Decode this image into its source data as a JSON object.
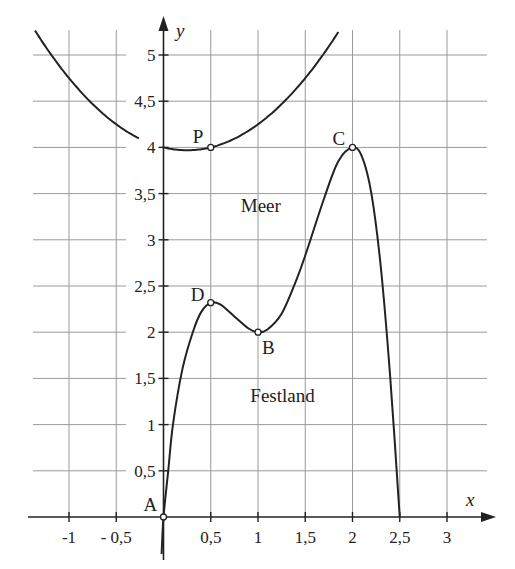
{
  "diagram": {
    "axes": {
      "x_label": "x",
      "y_label": "y",
      "x_ticks": [
        {
          "value": -1,
          "label": "-1"
        },
        {
          "value": -0.5,
          "label": "- 0,5"
        },
        {
          "value": 0.5,
          "label": "0,5"
        },
        {
          "value": 1,
          "label": "1"
        },
        {
          "value": 1.5,
          "label": "1,5"
        },
        {
          "value": 2,
          "label": "2"
        },
        {
          "value": 2.5,
          "label": "2,5"
        },
        {
          "value": 3,
          "label": "3"
        }
      ],
      "y_ticks": [
        {
          "value": 0.5,
          "label": "0,5"
        },
        {
          "value": 1,
          "label": "1"
        },
        {
          "value": 1.5,
          "label": "1,5"
        },
        {
          "value": 2,
          "label": "2"
        },
        {
          "value": 2.5,
          "label": "2,5"
        },
        {
          "value": 3,
          "label": "3"
        },
        {
          "value": 3.5,
          "label": "3,5"
        },
        {
          "value": 4,
          "label": "4"
        },
        {
          "value": 4.5,
          "label": "4,5"
        },
        {
          "value": 5,
          "label": "5"
        }
      ],
      "x_range": [
        -1.4,
        3.4
      ],
      "y_range": [
        -0.4,
        5.3
      ],
      "grid": true
    },
    "points": [
      {
        "name": "A",
        "x": 0,
        "y": 0,
        "label_dx": -20,
        "label_dy": -6
      },
      {
        "name": "D",
        "x": 0.5,
        "y": 2.32,
        "label_dx": -20,
        "label_dy": -2
      },
      {
        "name": "B",
        "x": 1,
        "y": 2,
        "label_dx": 4,
        "label_dy": 22
      },
      {
        "name": "C",
        "x": 2,
        "y": 4,
        "label_dx": -20,
        "label_dy": -2
      },
      {
        "name": "P",
        "x": 0.5,
        "y": 4,
        "label_dx": -18,
        "label_dy": -4
      }
    ],
    "regions": [
      {
        "label": "Meer",
        "x": 1.03,
        "y": 3.3
      },
      {
        "label": "Festland",
        "x": 1.26,
        "y": 1.25
      }
    ],
    "curves": {
      "coast": [
        [
          -0.02,
          -0.4
        ],
        [
          0,
          0
        ],
        [
          0.05,
          0.5
        ],
        [
          0.1,
          1.0
        ],
        [
          0.2,
          1.6
        ],
        [
          0.31,
          2.0
        ],
        [
          0.4,
          2.22
        ],
        [
          0.5,
          2.32
        ],
        [
          0.6,
          2.3
        ],
        [
          0.75,
          2.17
        ],
        [
          0.9,
          2.04
        ],
        [
          1.0,
          2.0
        ],
        [
          1.1,
          2.03
        ],
        [
          1.25,
          2.2
        ],
        [
          1.4,
          2.55
        ],
        [
          1.5,
          2.83
        ],
        [
          1.7,
          3.45
        ],
        [
          1.85,
          3.85
        ],
        [
          2.0,
          4.0
        ],
        [
          2.1,
          3.9
        ],
        [
          2.2,
          3.5
        ],
        [
          2.3,
          2.7
        ],
        [
          2.4,
          1.5
        ],
        [
          2.5,
          0.0
        ]
      ],
      "parabola": {
        "a": 0.5,
        "h": 0.25,
        "k": 3.96875,
        "segments": [
          [
            -1.36,
            -0.26
          ],
          [
            -0.01,
            1.86
          ]
        ]
      }
    },
    "colors": {
      "curve": "#222222",
      "grid": "#9a9a9a",
      "axis": "#222222",
      "background": "#ffffff"
    }
  }
}
